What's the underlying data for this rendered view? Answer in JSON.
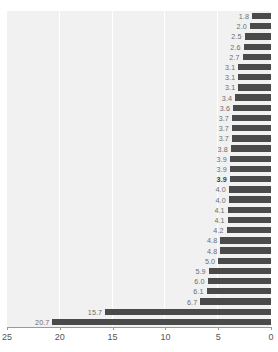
{
  "title": "",
  "chart_data": {
    "type": "bar",
    "orientation": "horizontal",
    "title": "",
    "subtitle": "",
    "xlabel": "",
    "ylabel": "",
    "xlim": [
      25,
      0
    ],
    "x_axis_reversed": true,
    "grid": true,
    "legend": false,
    "legend_position": "none",
    "bar_color": "#4a4a4a",
    "plot_background": "#f1f1f1",
    "gridline_color": "#ffffff",
    "label_color": "#6d6d6d",
    "highlight_label_color": "#3a3a3a",
    "axis_tick_labels": [
      "25",
      "20",
      "15",
      "10",
      "5",
      "0"
    ],
    "axis_tick_values": [
      25,
      20,
      15,
      10,
      5,
      0
    ],
    "categories": [
      "",
      "",
      "",
      "",
      "",
      "",
      "",
      "",
      "",
      "",
      "",
      "",
      "",
      "",
      "",
      "",
      "",
      "",
      "",
      "",
      "",
      "",
      "",
      "",
      "",
      "",
      "",
      "",
      "",
      "",
      ""
    ],
    "values": [
      1.8,
      2.0,
      2.5,
      2.6,
      2.7,
      3.1,
      3.1,
      3.1,
      3.4,
      3.6,
      3.7,
      3.7,
      3.7,
      3.8,
      3.9,
      3.9,
      3.9,
      4.0,
      4.0,
      4.1,
      4.1,
      4.2,
      4.8,
      4.8,
      5.0,
      5.9,
      6.0,
      6.1,
      6.7,
      15.7,
      20.7
    ],
    "data_labels": [
      "1.8",
      "2.0",
      "2.5",
      "2.6",
      "2.7",
      "3.1",
      "3.1",
      "3.1",
      "3.4",
      "3.6",
      "3.7",
      "3.7",
      "3.7",
      "3.8",
      "3.9",
      "3.9",
      "3.9",
      "4.0",
      "4.0",
      "4.1",
      "4.1",
      "4.2",
      "4.8",
      "4.8",
      "5.0",
      "5.9",
      "6.0",
      "6.1",
      "6.7",
      "15.7",
      "20.7"
    ],
    "highlighted_index": 16,
    "highlighted_value": "3.9",
    "sort_order": "ascending-top-to-bottom"
  }
}
